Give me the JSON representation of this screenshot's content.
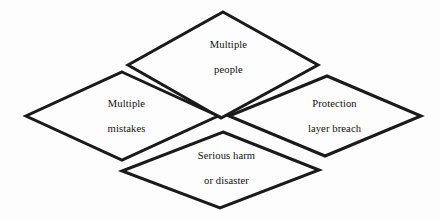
{
  "diagram": {
    "type": "diamond-cluster",
    "title_present": false,
    "background_color": "#fdfdfd",
    "stroke_color": "#1a1a1a",
    "text_color": "#101010",
    "stroke_width": 3,
    "nodes": [
      {
        "id": "top",
        "name": "multiple-people",
        "label_line1": "Multiple",
        "label_line2": "people",
        "shape": "diamond",
        "center_x": 223,
        "center_y": 65,
        "half_width": 95,
        "half_height": 53,
        "text_x": 223,
        "text_y": 57
      },
      {
        "id": "left",
        "name": "multiple-mistakes",
        "label_line1": "Multiple",
        "label_line2": "mistakes",
        "shape": "diamond",
        "center_x": 122,
        "center_y": 116,
        "half_width": 96,
        "half_height": 44,
        "text_x": 121,
        "text_y": 116
      },
      {
        "id": "right",
        "name": "protection-layer-breach",
        "label_line1": "Protection",
        "label_line2": "layer breach",
        "shape": "diamond",
        "center_x": 325,
        "center_y": 116,
        "half_width": 96,
        "half_height": 40,
        "text_x": 329,
        "text_y": 116
      },
      {
        "id": "bottom",
        "name": "serious-harm-or-disaster",
        "label_line1": "Serious harm",
        "label_line2": "or disaster",
        "shape": "diamond",
        "center_x": 221,
        "center_y": 170,
        "half_width": 98,
        "half_height": 38,
        "text_x": 221,
        "text_y": 168
      }
    ]
  }
}
